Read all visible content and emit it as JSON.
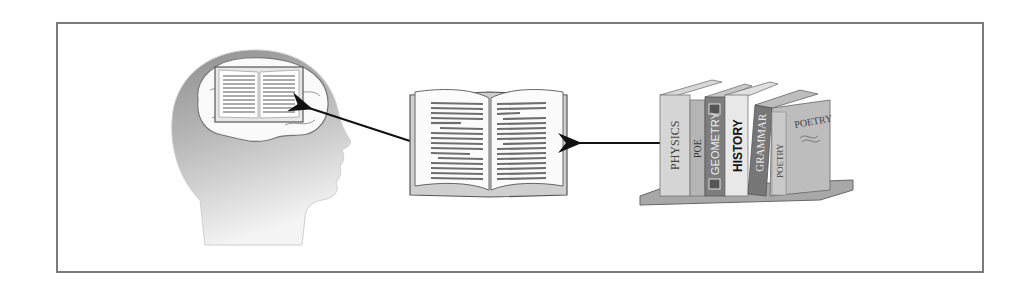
{
  "diagram": {
    "nodes": [
      {
        "id": "head",
        "label": "Head with brain containing an open book"
      },
      {
        "id": "open_book",
        "label": "Open book"
      },
      {
        "id": "bookshelf",
        "label": "Books on a shelf"
      }
    ],
    "edges": [
      {
        "from": "bookshelf",
        "to": "open_book"
      },
      {
        "from": "open_book",
        "to": "head"
      }
    ],
    "book_spines": [
      "PHYSICS",
      "POE",
      "GEOMETRY",
      "HISTORY",
      "GRAMMAR",
      "POETRY"
    ],
    "front_cover_title": "POETRY",
    "colors": {
      "frame": "#7a7a7a",
      "arrow": "#111111",
      "head_dark": "#9a9a9a",
      "head_light": "#f2f2f2"
    }
  }
}
